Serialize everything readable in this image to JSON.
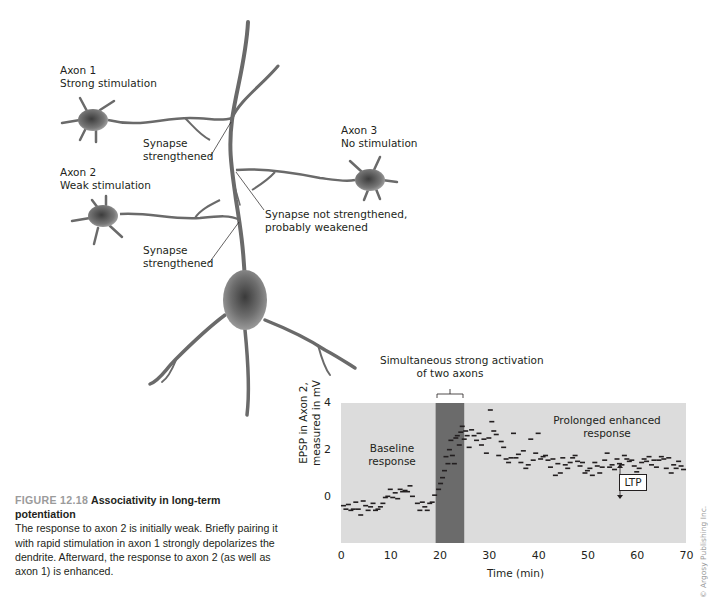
{
  "figure": {
    "number": "FIGURE 12.18",
    "title": "Associativity in long-term potentiation",
    "caption": "The response to axon 2 is initially weak. Briefly pairing it with rapid stimulation in axon 1 strongly depolarizes the dendrite. Afterward, the response to axon 2 (as well as axon 1) is enhanced."
  },
  "diagram": {
    "axon1": {
      "name": "Axon 1",
      "desc": "Strong stimulation"
    },
    "axon2": {
      "name": "Axon 2",
      "desc": "Weak stimulation"
    },
    "axon3": {
      "name": "Axon 3",
      "desc": "No stimulation"
    },
    "synapse1": {
      "line1": "Synapse",
      "line2": "strengthened"
    },
    "synapse2": {
      "line1": "Synapse",
      "line2": "strengthened"
    },
    "synapse3": {
      "line1": "Synapse not strengthened,",
      "line2": "probably weakened"
    }
  },
  "copyright": "© Argosy Publishing Inc.",
  "colors": {
    "plot_bg": "#dcdcdc",
    "stim_band": "#6b6b6b",
    "marker": "#231f20"
  },
  "chart_data": {
    "type": "scatter",
    "title": "",
    "xlabel": "Time (min)",
    "ylabel": "EPSP in Axon 2, measured in mV",
    "ylabel_lines": [
      "EPSP in Axon 2,",
      "measured in mV"
    ],
    "xlim": [
      0,
      70
    ],
    "ylim": [
      -2,
      4
    ],
    "xticks": [
      "0",
      "10",
      "20",
      "30",
      "40",
      "50",
      "60",
      "70"
    ],
    "yticks": [
      "0",
      "2",
      "4"
    ],
    "grid": false,
    "marker": "dash",
    "annotations": {
      "stimulation": {
        "line1": "Simultaneous strong activation",
        "line2": "of two axons",
        "x_start": 19.2,
        "x_end": 25
      },
      "baseline": {
        "line1": "Baseline",
        "line2": "response"
      },
      "enhanced": {
        "line1": "Prolonged enhanced",
        "line2": "response"
      },
      "ltp": {
        "label": "LTP",
        "x": 56.5
      }
    },
    "series": [
      {
        "name": "EPSP (Axon 2)",
        "points": [
          [
            0.5,
            -0.4
          ],
          [
            1,
            -0.55
          ],
          [
            1.5,
            -0.35
          ],
          [
            2,
            -0.6
          ],
          [
            2.5,
            -0.55
          ],
          [
            3,
            -0.25
          ],
          [
            3.5,
            -0.55
          ],
          [
            4,
            -0.8
          ],
          [
            4.5,
            -0.2
          ],
          [
            5,
            -0.4
          ],
          [
            5.5,
            -0.6
          ],
          [
            6,
            -0.45
          ],
          [
            6.5,
            -0.3
          ],
          [
            7,
            -0.6
          ],
          [
            7.5,
            -0.55
          ],
          [
            8,
            -0.45
          ],
          [
            8.5,
            -0.3
          ],
          [
            9,
            -0.05
          ],
          [
            9.5,
            0.0
          ],
          [
            10,
            0.3
          ],
          [
            10.5,
            -0.05
          ],
          [
            11,
            0.15
          ],
          [
            11.5,
            -0.1
          ],
          [
            12,
            0.3
          ],
          [
            12.5,
            0.2
          ],
          [
            13,
            0.25
          ],
          [
            13.5,
            0.2
          ],
          [
            14,
            0.45
          ],
          [
            14.5,
            0.0
          ],
          [
            15.5,
            -0.3
          ],
          [
            16,
            -0.6
          ],
          [
            16.5,
            -0.25
          ],
          [
            17,
            -0.45
          ],
          [
            17.5,
            -0.6
          ],
          [
            18,
            -0.3
          ],
          [
            18.5,
            -0.25
          ],
          [
            19,
            0.05
          ],
          [
            19.8,
            0.3
          ],
          [
            20.2,
            0.55
          ],
          [
            20.6,
            0.8
          ],
          [
            21,
            1.1
          ],
          [
            21.3,
            1.7
          ],
          [
            21.7,
            1.4
          ],
          [
            22,
            2.0
          ],
          [
            22.3,
            2.4
          ],
          [
            22.6,
            1.75
          ],
          [
            23,
            1.4
          ],
          [
            23.3,
            2.5
          ],
          [
            23.6,
            2.6
          ],
          [
            24,
            2.2
          ],
          [
            24.3,
            2.75
          ],
          [
            24.6,
            3.0
          ],
          [
            25,
            2.45
          ],
          [
            25.3,
            2.8
          ],
          [
            25.6,
            2.6
          ],
          [
            26,
            2.1
          ],
          [
            26.5,
            2.85
          ],
          [
            27,
            2.6
          ],
          [
            27.5,
            2.4
          ],
          [
            28,
            2.7
          ],
          [
            28.5,
            2.2
          ],
          [
            29,
            2.45
          ],
          [
            29.5,
            1.85
          ],
          [
            30,
            2.5
          ],
          [
            30.3,
            3.7
          ],
          [
            30.6,
            3.2
          ],
          [
            31,
            2.8
          ],
          [
            31.5,
            2.65
          ],
          [
            32,
            1.75
          ],
          [
            32.5,
            2.35
          ],
          [
            33,
            2.1
          ],
          [
            33.5,
            1.6
          ],
          [
            34,
            1.45
          ],
          [
            34.5,
            1.65
          ],
          [
            35,
            2.7
          ],
          [
            35.5,
            1.65
          ],
          [
            36,
            1.8
          ],
          [
            36.5,
            1.45
          ],
          [
            37,
            1.95
          ],
          [
            37.5,
            1.2
          ],
          [
            38,
            1.35
          ],
          [
            38.5,
            2.45
          ],
          [
            39,
            1.55
          ],
          [
            39.5,
            1.85
          ],
          [
            40,
            2.7
          ],
          [
            40.5,
            1.6
          ],
          [
            41,
            1.7
          ],
          [
            41.5,
            1.75
          ],
          [
            42,
            1.55
          ],
          [
            42.5,
            1.25
          ],
          [
            43,
            1.6
          ],
          [
            43.5,
            0.9
          ],
          [
            44,
            1.4
          ],
          [
            44.5,
            1.0
          ],
          [
            45,
            1.65
          ],
          [
            45.5,
            1.35
          ],
          [
            46,
            1.2
          ],
          [
            46.5,
            1.45
          ],
          [
            47,
            1.65
          ],
          [
            47.5,
            1.75
          ],
          [
            48,
            1.5
          ],
          [
            48.5,
            1.3
          ],
          [
            49,
            1.45
          ],
          [
            49.5,
            1.0
          ],
          [
            50,
            1.1
          ],
          [
            50.5,
            1.2
          ],
          [
            51,
            0.9
          ],
          [
            51.5,
            1.45
          ],
          [
            52,
            1.3
          ],
          [
            52.5,
            1.0
          ],
          [
            53,
            1.25
          ],
          [
            53.5,
            1.55
          ],
          [
            54,
            1.85
          ],
          [
            54.5,
            1.25
          ],
          [
            55,
            1.35
          ],
          [
            55.5,
            1.15
          ],
          [
            56,
            1.6
          ],
          [
            56.5,
            1.4
          ],
          [
            57,
            1.35
          ],
          [
            57.5,
            1.75
          ],
          [
            58,
            1.6
          ],
          [
            58.5,
            1.5
          ],
          [
            59,
            1.55
          ],
          [
            59.5,
            1.3
          ],
          [
            60,
            1.05
          ],
          [
            60.5,
            1.2
          ],
          [
            61,
            1.45
          ],
          [
            61.5,
            1.6
          ],
          [
            62,
            1.5
          ],
          [
            62.5,
            1.7
          ],
          [
            63,
            1.35
          ],
          [
            63.5,
            1.55
          ],
          [
            64,
            1.25
          ],
          [
            64.5,
            1.55
          ],
          [
            65,
            1.7
          ],
          [
            65.5,
            1.6
          ],
          [
            66,
            1.2
          ],
          [
            66.5,
            1.65
          ],
          [
            67,
            1.0
          ],
          [
            67.5,
            1.35
          ],
          [
            68,
            1.2
          ],
          [
            68.5,
            1.5
          ],
          [
            69,
            1.3
          ],
          [
            69.5,
            1.15
          ]
        ]
      }
    ]
  }
}
